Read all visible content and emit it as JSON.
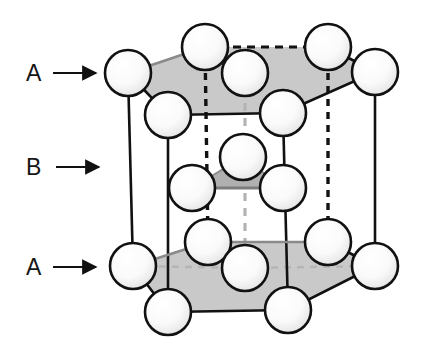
{
  "figure": {
    "background_color": "#ffffff",
    "labels": [
      {
        "id": "label-a-top",
        "text": "A",
        "x": 26,
        "y": 62,
        "arrow": {
          "x1": 53,
          "y1": 73,
          "x2": 97,
          "y2": 73
        }
      },
      {
        "id": "label-b-mid",
        "text": "B",
        "x": 26,
        "y": 156,
        "arrow": {
          "x1": 53,
          "y1": 167,
          "x2": 97,
          "y2": 167
        }
      },
      {
        "id": "label-a-bot",
        "text": "A",
        "x": 26,
        "y": 256,
        "arrow": {
          "x1": 53,
          "y1": 267,
          "x2": 97,
          "y2": 267
        }
      }
    ]
  },
  "style": {
    "atom_fill_light": "#fbfbfb",
    "atom_fill_shade": "#e3e3e3",
    "atom_stroke": "#111111",
    "atom_stroke_width": 2.6,
    "atom_radius": 23,
    "plane_fill": "#c9c9c9",
    "plane_fill_mid": "#b5b5b5",
    "edge_solid_color": "#111111",
    "edge_solid_width": 2.6,
    "edge_dashed_color": "#111111",
    "edge_hidden_color": "#b0b0b0",
    "arrow_color": "#111111"
  },
  "structure": {
    "type": "hexagonal-close-packed",
    "layer_sequence": [
      "A",
      "B",
      "A"
    ],
    "layers": [
      {
        "name": "A-top",
        "label": "A",
        "hexagon": [
          {
            "x": 128,
            "y": 73
          },
          {
            "x": 205,
            "y": 47
          },
          {
            "x": 328,
            "y": 47
          },
          {
            "x": 375,
            "y": 72
          },
          {
            "x": 283,
            "y": 113
          },
          {
            "x": 168,
            "y": 115
          }
        ],
        "center": {
          "x": 245,
          "y": 73
        },
        "atom_count": 7
      },
      {
        "name": "B-middle",
        "label": "B",
        "triangle": [
          {
            "x": 243,
            "y": 157
          },
          {
            "x": 192,
            "y": 188
          },
          {
            "x": 283,
            "y": 188
          }
        ],
        "atom_count": 3
      },
      {
        "name": "A-bottom",
        "label": "A",
        "hexagon": [
          {
            "x": 133,
            "y": 266
          },
          {
            "x": 208,
            "y": 242
          },
          {
            "x": 328,
            "y": 242
          },
          {
            "x": 375,
            "y": 266
          },
          {
            "x": 288,
            "y": 310
          },
          {
            "x": 168,
            "y": 312
          }
        ],
        "center": {
          "x": 245,
          "y": 268
        },
        "atom_count": 7
      }
    ],
    "vertical_edges": [
      {
        "from": {
          "x": 128,
          "y": 73
        },
        "to": {
          "x": 133,
          "y": 266
        },
        "style": "solid"
      },
      {
        "from": {
          "x": 168,
          "y": 115
        },
        "to": {
          "x": 168,
          "y": 312
        },
        "style": "solid"
      },
      {
        "from": {
          "x": 283,
          "y": 113
        },
        "to": {
          "x": 288,
          "y": 310
        },
        "style": "solid"
      },
      {
        "from": {
          "x": 375,
          "y": 72
        },
        "to": {
          "x": 375,
          "y": 266
        },
        "style": "solid"
      },
      {
        "from": {
          "x": 205,
          "y": 47
        },
        "to": {
          "x": 208,
          "y": 242
        },
        "style": "dashed"
      },
      {
        "from": {
          "x": 328,
          "y": 47
        },
        "to": {
          "x": 328,
          "y": 242
        },
        "style": "dashed"
      },
      {
        "from": {
          "x": 245,
          "y": 73
        },
        "to": {
          "x": 245,
          "y": 268
        },
        "style": "dashed-light"
      }
    ]
  }
}
